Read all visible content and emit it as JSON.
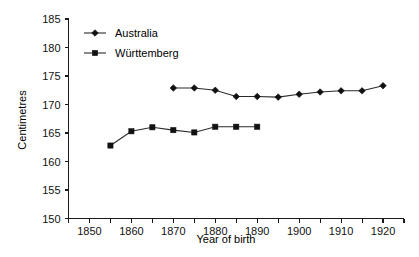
{
  "chart_data": {
    "type": "line",
    "title": "",
    "xlabel": "Year of birth",
    "ylabel": "Centimetres",
    "xlim": [
      1845,
      1925
    ],
    "ylim": [
      150,
      185
    ],
    "ytick_step": 5,
    "xtick_step": 5,
    "xtick_label_step": 10,
    "grid": false,
    "legend_position": "top-left-inside",
    "yticks": [
      150,
      155,
      160,
      165,
      170,
      175,
      180,
      185
    ],
    "ytick_labels": [
      "150",
      "155",
      "160",
      "165",
      "170",
      "175",
      "180",
      "185"
    ],
    "xticks": [
      1845,
      1850,
      1855,
      1860,
      1865,
      1870,
      1875,
      1880,
      1885,
      1890,
      1895,
      1900,
      1905,
      1910,
      1915,
      1920,
      1925
    ],
    "xtick_labels": [
      "1850",
      "1860",
      "1870",
      "1880",
      "1890",
      "1900",
      "1910",
      "1920"
    ],
    "xtick_label_values": [
      1850,
      1860,
      1870,
      1880,
      1890,
      1900,
      1910,
      1920
    ],
    "series": [
      {
        "name": "Australia",
        "marker": "diamond",
        "color": "#111111",
        "x": [
          1870,
          1875,
          1880,
          1885,
          1890,
          1895,
          1900,
          1905,
          1910,
          1915,
          1920
        ],
        "values": [
          172.9,
          172.9,
          172.5,
          171.4,
          171.4,
          171.3,
          171.8,
          172.2,
          172.4,
          172.4,
          173.3
        ]
      },
      {
        "name": "Württemberg",
        "marker": "square",
        "color": "#111111",
        "x": [
          1855,
          1860,
          1865,
          1870,
          1875,
          1880,
          1885,
          1890
        ],
        "values": [
          162.8,
          165.3,
          166.0,
          165.5,
          165.1,
          166.1,
          166.1,
          166.1
        ]
      }
    ]
  },
  "legend": {
    "entries": [
      {
        "label": "Australia",
        "marker": "diamond"
      },
      {
        "label": "Württemberg",
        "marker": "square"
      }
    ]
  }
}
